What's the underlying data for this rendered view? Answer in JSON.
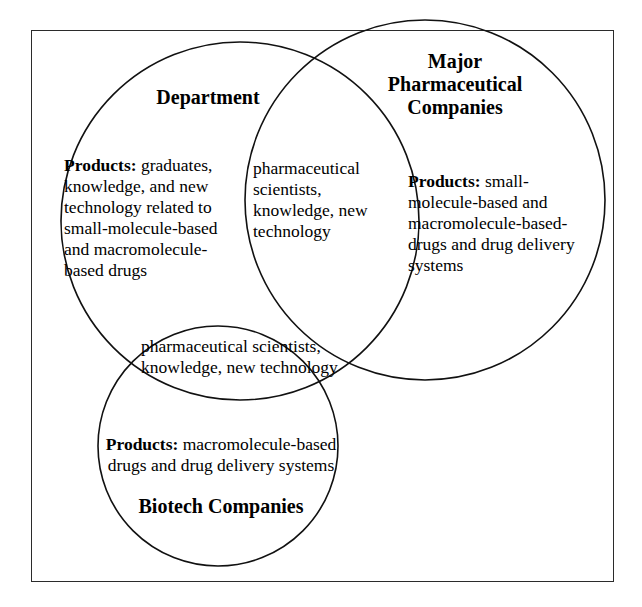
{
  "figure": {
    "type": "venn-diagram",
    "set_count": 3,
    "frame_color": "#2b2b2b",
    "circle_stroke_color": "#111111",
    "background_color": "#ffffff",
    "text_color": "#000000"
  },
  "sets": {
    "department": {
      "title": "Department",
      "products_label": "Products:",
      "products_text": " graduates, knowledge, and new technology related to small-molecule-based and macromolecule-based drugs"
    },
    "major_pharma": {
      "title_line1": "Major",
      "title_line2": "Pharmaceutical",
      "title_line3": "Companies",
      "products_label": "Products:",
      "products_text": " small-molecule-based and macromolecule-based-drugs and drug delivery systems"
    },
    "biotech": {
      "title": "Biotech Companies",
      "products_label": "Products:",
      "products_text": " macromolecule-based drugs and drug delivery systems"
    }
  },
  "intersections": {
    "department_major_pharma": {
      "text": "pharmaceutical scientists, knowledge, new technology"
    },
    "department_biotech": {
      "text": "pharmaceutical scientists, knowledge, new technology"
    }
  }
}
